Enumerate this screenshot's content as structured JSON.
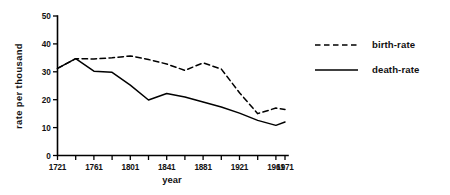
{
  "chart_data": {
    "type": "line",
    "title": "",
    "xlabel": "year",
    "ylabel": "rate per thousand",
    "xlim": [
      1721,
      1971
    ],
    "ylim": [
      0,
      50
    ],
    "grid": false,
    "legend_position": "right",
    "x_ticks_major": [
      1721,
      1761,
      1801,
      1841,
      1881,
      1921,
      1961,
      1971
    ],
    "x_tick_labels": [
      "1721",
      "1761",
      "1801",
      "1841",
      "1881",
      "1921",
      "1961",
      "1971"
    ],
    "x_ticks_minor": [
      1741,
      1781,
      1821,
      1861,
      1901,
      1941
    ],
    "y_ticks": [
      0,
      10,
      20,
      30,
      40,
      50
    ],
    "y_tick_labels": [
      "0",
      "10",
      "20",
      "30",
      "40",
      "50"
    ],
    "x": [
      1721,
      1741,
      1761,
      1781,
      1801,
      1821,
      1841,
      1861,
      1881,
      1901,
      1921,
      1941,
      1961,
      1971
    ],
    "series": [
      {
        "name": "birth-rate",
        "style": "dashed",
        "color": "#000000",
        "values": [
          31.2,
          34.7,
          34.6,
          35.0,
          35.7,
          34.4,
          32.8,
          30.5,
          33.2,
          31.0,
          22.5,
          15.0,
          17.0,
          16.5
        ]
      },
      {
        "name": "death-rate",
        "style": "solid",
        "color": "#000000",
        "values": [
          31.2,
          34.7,
          30.2,
          29.8,
          25.2,
          19.9,
          22.2,
          21.0,
          19.2,
          17.4,
          15.2,
          12.6,
          10.8,
          12.0
        ]
      }
    ]
  },
  "legend": {
    "entries": [
      {
        "label": "birth-rate",
        "style": "dashed"
      },
      {
        "label": "death-rate",
        "style": "solid"
      }
    ]
  }
}
